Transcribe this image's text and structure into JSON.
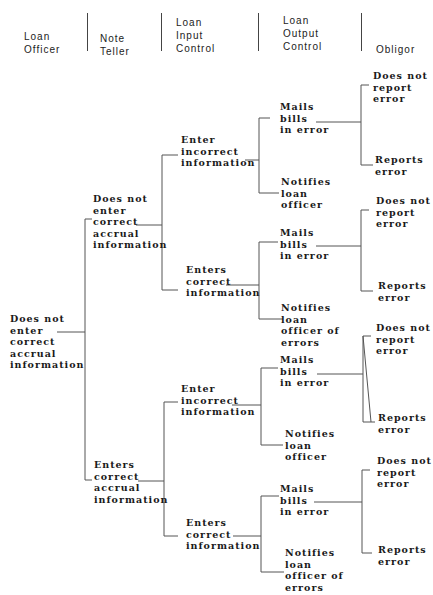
{
  "headers": [
    "Loan\nOfficer",
    "Note\nTeller",
    "Loan\nInput\nControl",
    "Loan\nOutput\nControl",
    "Obligor"
  ],
  "root": "Does not\nenter\ncorrect\naccrual\ninformation",
  "note_teller": [
    "Does not\nenter\ncorrect\naccrual\ninformation",
    "Enters\ncorrect\naccrual\ninformation"
  ],
  "input_control": [
    "Enter\nincorrect\ninformation",
    "Enters\ncorrect\ninformation",
    "Enter\nincorrect\ninformation",
    "Enters\ncorrect\ninformation"
  ],
  "output_control": [
    "Mails\nbills\nin error",
    "Notifies\nloan\nofficer",
    "Mails\nbills\nin error",
    "Notifies\nloan\nofficer of\nerrors",
    "Mails\nbills\nin error",
    "Notifies\nloan\nofficer",
    "Mails\nbills\nin error",
    "Notifies\nloan\nofficer of\nerrors"
  ],
  "obligor": [
    "Does not\nreport\nerror",
    "Reports\nerror",
    "Does not\nreport\nerror",
    "Reports\nerror",
    "Does not\nreport\nerror",
    "Reports\nerror",
    "Does not\nreport\nerror",
    "Reports\nerror"
  ]
}
